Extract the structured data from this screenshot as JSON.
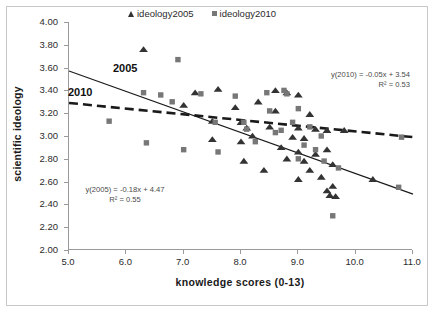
{
  "chart_data": {
    "type": "scatter",
    "title": "",
    "xlabel": "knowledge scores (0-13)",
    "ylabel": "scientific ideology",
    "xlim": [
      5.0,
      11.0
    ],
    "ylim": [
      2.0,
      4.0
    ],
    "xticks": [
      "5.0",
      "6.0",
      "7.0",
      "8.0",
      "9.0",
      "10.0",
      "11.0"
    ],
    "yticks": [
      "4.00",
      "3.80",
      "3.60",
      "3.40",
      "3.20",
      "3.00",
      "2.80",
      "2.60",
      "2.40",
      "2.20",
      "2.00"
    ],
    "grid": false,
    "legend_position": "top-center",
    "series": [
      {
        "name": "ideology2005",
        "marker": "triangle",
        "color": "#333333",
        "points": [
          [
            6.3,
            3.76
          ],
          [
            7.2,
            3.38
          ],
          [
            7.6,
            3.41
          ],
          [
            7.0,
            3.27
          ],
          [
            7.9,
            3.25
          ],
          [
            8.3,
            3.3
          ],
          [
            7.5,
            3.13
          ],
          [
            8.0,
            3.12
          ],
          [
            8.1,
            3.07
          ],
          [
            7.5,
            2.97
          ],
          [
            8.0,
            2.95
          ],
          [
            8.6,
            3.22
          ],
          [
            8.8,
            3.38
          ],
          [
            8.6,
            3.4
          ],
          [
            9.0,
            3.36
          ],
          [
            9.2,
            3.19
          ],
          [
            8.5,
            3.08
          ],
          [
            9.0,
            3.07
          ],
          [
            9.3,
            3.06
          ],
          [
            9.5,
            3.05
          ],
          [
            8.2,
            3.0
          ],
          [
            8.9,
            2.99
          ],
          [
            9.1,
            2.98
          ],
          [
            8.7,
            2.9
          ],
          [
            9.0,
            2.86
          ],
          [
            9.3,
            2.84
          ],
          [
            8.8,
            2.8
          ],
          [
            9.1,
            2.78
          ],
          [
            9.5,
            2.88
          ],
          [
            9.6,
            2.75
          ],
          [
            9.2,
            2.7
          ],
          [
            9.4,
            2.64
          ],
          [
            9.0,
            2.62
          ],
          [
            9.6,
            2.56
          ],
          [
            9.5,
            2.52
          ],
          [
            9.55,
            2.48
          ],
          [
            9.65,
            2.47
          ],
          [
            10.3,
            2.62
          ],
          [
            9.8,
            3.05
          ],
          [
            8.4,
            2.7
          ],
          [
            8.05,
            2.78
          ]
        ]
      },
      {
        "name": "ideology2010",
        "marker": "square",
        "color": "#777777",
        "points": [
          [
            5.7,
            3.13
          ],
          [
            6.3,
            3.38
          ],
          [
            6.6,
            3.36
          ],
          [
            6.9,
            3.67
          ],
          [
            6.8,
            3.3
          ],
          [
            7.3,
            3.37
          ],
          [
            6.35,
            2.94
          ],
          [
            7.0,
            2.88
          ],
          [
            7.55,
            3.12
          ],
          [
            7.6,
            2.86
          ],
          [
            8.05,
            3.12
          ],
          [
            8.1,
            3.06
          ],
          [
            8.45,
            3.38
          ],
          [
            8.5,
            3.22
          ],
          [
            8.75,
            3.4
          ],
          [
            8.8,
            3.37
          ],
          [
            9.0,
            3.24
          ],
          [
            8.9,
            3.12
          ],
          [
            8.7,
            3.05
          ],
          [
            8.6,
            3.03
          ],
          [
            9.2,
            3.08
          ],
          [
            9.4,
            3.0
          ],
          [
            9.3,
            2.88
          ],
          [
            9.0,
            2.8
          ],
          [
            9.45,
            2.78
          ],
          [
            9.1,
            2.92
          ],
          [
            9.7,
            2.72
          ],
          [
            9.6,
            2.3
          ],
          [
            10.8,
            2.99
          ],
          [
            10.75,
            2.55
          ],
          [
            8.25,
            2.95
          ],
          [
            7.9,
            3.35
          ]
        ]
      }
    ],
    "trendlines": [
      {
        "name": "2005",
        "label": "2005",
        "style": "solid",
        "color": "#1a1a1a",
        "slope": -0.18,
        "intercept": 4.47,
        "equation": "y(2005) = -0.18x + 4.47",
        "r2_text": "R² = 0.55",
        "r2": 0.55
      },
      {
        "name": "2010",
        "label": "2010",
        "style": "dashed",
        "color": "#1a1a1a",
        "slope": -0.05,
        "intercept": 3.54,
        "equation": "y(2010) = -0.05x + 3.54",
        "r2_text": "R² = 0.53",
        "r2": 0.53
      }
    ],
    "legend": [
      {
        "label": "ideology2005",
        "marker": "triangle",
        "color": "#333333"
      },
      {
        "label": "ideology2010",
        "marker": "square",
        "color": "#777777"
      }
    ]
  }
}
